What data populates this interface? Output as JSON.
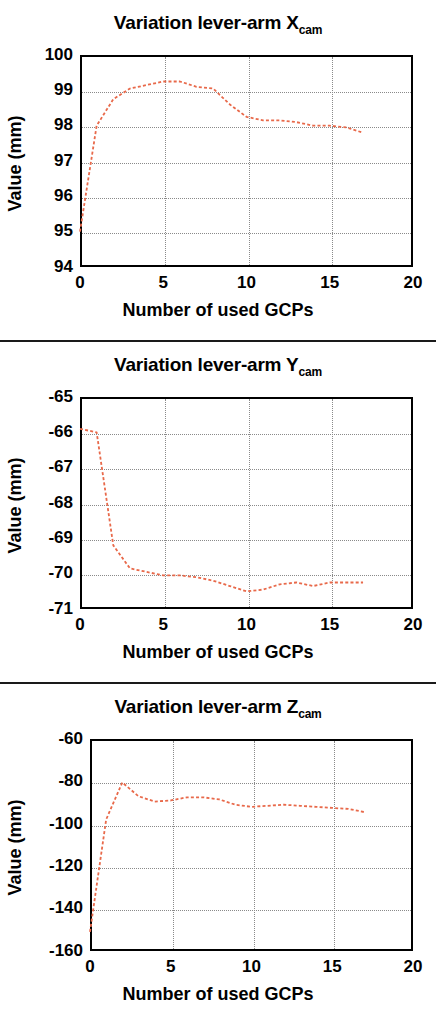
{
  "figure": {
    "panels": [
      {
        "title_prefix": "Variation lever-arm X",
        "title_sub": "cam",
        "xlabel": "Number of used GCPs",
        "ylabel": "Value (mm)"
      },
      {
        "title_prefix": "Variation lever-arm Y",
        "title_sub": "cam",
        "xlabel": "Number of used GCPs",
        "ylabel": "Value (mm)"
      },
      {
        "title_prefix": "Variation lever-arm Z",
        "title_sub": "cam",
        "xlabel": "Number of used GCPs",
        "ylabel": "Value (mm)"
      }
    ]
  },
  "chart_data": [
    {
      "type": "line",
      "title": "Variation lever-arm Xcam",
      "xlabel": "Number of used GCPs",
      "ylabel": "Value (mm)",
      "xlim": [
        0,
        20
      ],
      "ylim": [
        94,
        100
      ],
      "xticks": [
        0,
        5,
        10,
        15,
        20
      ],
      "yticks": [
        94,
        95,
        96,
        97,
        98,
        99,
        100
      ],
      "xtick_labels": [
        "0",
        "5",
        "10",
        "15",
        "20"
      ],
      "ytick_labels": [
        "94",
        "95",
        "96",
        "97",
        "98",
        "99",
        "100"
      ],
      "grid": true,
      "legend": null,
      "line_color": "#e8694a",
      "line_style": "dotted",
      "series": [
        {
          "name": "lever-arm Xcam",
          "x": [
            0,
            1,
            2,
            3,
            4,
            5,
            6,
            7,
            8,
            9,
            10,
            11,
            12,
            13,
            14,
            15,
            16,
            17
          ],
          "values": [
            95.0,
            98.0,
            98.75,
            99.05,
            99.15,
            99.25,
            99.25,
            99.1,
            99.05,
            98.6,
            98.25,
            98.15,
            98.15,
            98.1,
            98.0,
            98.0,
            97.95,
            97.8
          ]
        }
      ]
    },
    {
      "type": "line",
      "title": "Variation lever-arm Ycam",
      "xlabel": "Number of used GCPs",
      "ylabel": "Value (mm)",
      "xlim": [
        0,
        20
      ],
      "ylim": [
        -71,
        -65
      ],
      "xticks": [
        0,
        5,
        10,
        15,
        20
      ],
      "yticks": [
        -71,
        -70,
        -69,
        -68,
        -67,
        -66,
        -65
      ],
      "xtick_labels": [
        "0",
        "5",
        "10",
        "15",
        "20"
      ],
      "ytick_labels": [
        "-71",
        "-70",
        "-69",
        "-68",
        "-67",
        "-66",
        "-65"
      ],
      "grid": true,
      "legend": null,
      "line_color": "#e8694a",
      "line_style": "dotted",
      "series": [
        {
          "name": "lever-arm Ycam",
          "x": [
            0,
            1,
            2,
            3,
            4,
            5,
            6,
            7,
            8,
            9,
            10,
            11,
            12,
            13,
            14,
            15,
            16,
            17
          ],
          "values": [
            -65.9,
            -66.0,
            -69.2,
            -69.85,
            -69.95,
            -70.05,
            -70.05,
            -70.1,
            -70.2,
            -70.35,
            -70.5,
            -70.45,
            -70.3,
            -70.25,
            -70.35,
            -70.25,
            -70.25,
            -70.25
          ]
        }
      ]
    },
    {
      "type": "line",
      "title": "Variation lever-arm Zcam",
      "xlabel": "Number of used GCPs",
      "ylabel": "Value (mm)",
      "xlim": [
        0,
        20
      ],
      "ylim": [
        -160,
        -60
      ],
      "xticks": [
        0,
        5,
        10,
        15,
        20
      ],
      "yticks": [
        -160,
        -140,
        -120,
        -100,
        -80,
        -60
      ],
      "xtick_labels": [
        "0",
        "5",
        "10",
        "15",
        "20"
      ],
      "ytick_labels": [
        "-160",
        "-140",
        "-120",
        "-100",
        "-80",
        "-60"
      ],
      "grid": true,
      "legend": null,
      "line_color": "#e8694a",
      "line_style": "dotted",
      "series": [
        {
          "name": "lever-arm Zcam",
          "x": [
            0,
            1,
            2,
            3,
            4,
            5,
            6,
            7,
            8,
            9,
            10,
            11,
            12,
            13,
            14,
            15,
            16,
            17
          ],
          "values": [
            -151.0,
            -98.0,
            -80.5,
            -87.0,
            -89.5,
            -89.0,
            -87.5,
            -87.5,
            -88.5,
            -91.0,
            -92.0,
            -91.5,
            -91.0,
            -91.5,
            -92.0,
            -92.5,
            -93.0,
            -94.5
          ]
        }
      ]
    }
  ]
}
